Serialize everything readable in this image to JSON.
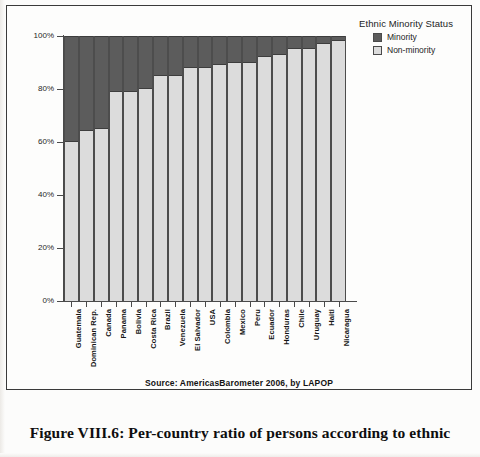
{
  "figure": {
    "source_note": "Source: AmericasBarometer 2006, by LAPOP",
    "caption": "Figure VIII.6: Per-country ratio of persons according to ethnic"
  },
  "legend": {
    "title": "Ethnic Minority Status",
    "items": [
      {
        "label": "Minority",
        "color": "#5c5c5c"
      },
      {
        "label": "Non-minority",
        "color": "#dcdcdc"
      }
    ]
  },
  "axes": {
    "y_ticks": [
      "0%",
      "20%",
      "40%",
      "60%",
      "80%",
      "100%"
    ]
  },
  "chart_data": {
    "type": "bar",
    "stacked": true,
    "normalized": true,
    "title": "",
    "subtitle": "",
    "xlabel": "",
    "ylabel": "",
    "ylim": [
      0,
      100
    ],
    "ytick_labels": [
      "0%",
      "20%",
      "40%",
      "60%",
      "80%",
      "100%"
    ],
    "ytick_values": [
      0,
      20,
      40,
      60,
      80,
      100
    ],
    "grid": false,
    "legend_position": "top-right",
    "legend_title": "Ethnic Minority Status",
    "categories": [
      "Guatemala",
      "Dominican Rep.",
      "Canada",
      "Panama",
      "Bolivia",
      "Costa Rica",
      "Brazil",
      "Venezuela",
      "El Salvador",
      "USA",
      "Colombia",
      "Mexico",
      "Peru",
      "Ecuador",
      "Honduras",
      "Chile",
      "Uruguay",
      "Haiti",
      "Nicaragua"
    ],
    "series": [
      {
        "name": "Minority",
        "color": "#5c5c5c",
        "values": [
          40,
          36,
          35,
          21,
          21,
          20,
          15,
          15,
          12,
          12,
          11,
          10,
          10,
          8,
          7,
          5,
          5,
          3,
          2
        ]
      },
      {
        "name": "Non-minority",
        "color": "#dcdcdc",
        "values": [
          60,
          64,
          65,
          79,
          79,
          80,
          85,
          85,
          88,
          88,
          89,
          90,
          90,
          92,
          93,
          95,
          95,
          97,
          98
        ]
      }
    ],
    "annotations": [
      "Source: AmericasBarometer 2006, by LAPOP"
    ]
  }
}
